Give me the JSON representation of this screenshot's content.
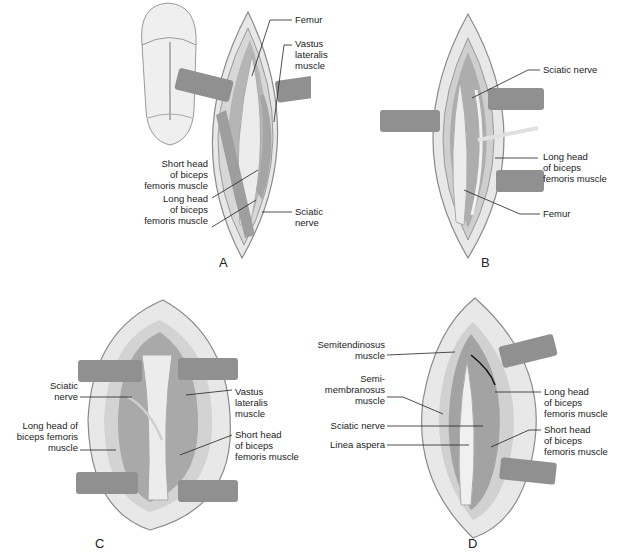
{
  "figure": {
    "panels": [
      {
        "id": "A",
        "letter": "A",
        "labels": [
          {
            "text": "Femur"
          },
          {
            "text": "Vastus\nlateralis\nmuscle"
          },
          {
            "text": "Short head\nof biceps\nfemoris muscle"
          },
          {
            "text": "Long head\nof biceps\nfemoris muscle"
          },
          {
            "text": "Sciatic\nnerve"
          }
        ]
      },
      {
        "id": "B",
        "letter": "B",
        "labels": [
          {
            "text": "Sciatic nerve"
          },
          {
            "text": "Long head\nof biceps\nfemoris muscle"
          },
          {
            "text": "Femur"
          }
        ]
      },
      {
        "id": "C",
        "letter": "C",
        "labels": [
          {
            "text": "Sciatic\nnerve"
          },
          {
            "text": "Long head of\nbiceps femoris\nmuscle"
          },
          {
            "text": "Vastus\nlateralis\nmuscle"
          },
          {
            "text": "Short head\nof biceps\nfemoris muscle"
          }
        ]
      },
      {
        "id": "D",
        "letter": "D",
        "labels": [
          {
            "text": "Semitendinosus\nmuscle"
          },
          {
            "text": "Semi-\nmembranosus\nmuscle"
          },
          {
            "text": "Sciatic nerve"
          },
          {
            "text": "Linea aspera"
          },
          {
            "text": "Long head\nof biceps\nfemoris muscle"
          },
          {
            "text": "Short head\nof biceps\nfemoris muscle"
          }
        ]
      }
    ],
    "colors": {
      "skin": "#ececec",
      "skin_edge": "#8a8a8a",
      "fat": "#dcdcdc",
      "muscle": "#a9a9a9",
      "muscle_dark": "#7d7d7d",
      "bone": "#e6e6e6",
      "retractor": "#8e8e8e",
      "leader": "#222222"
    }
  }
}
